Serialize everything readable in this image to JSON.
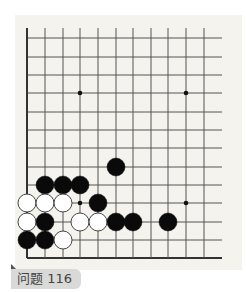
{
  "problem": {
    "label": "问题 116"
  },
  "board": {
    "col_x": [
      27,
      45,
      63,
      80,
      98,
      116,
      133,
      151,
      168,
      186,
      204
    ],
    "row_y": [
      38,
      57,
      75,
      93,
      112,
      130,
      148,
      167,
      185,
      203,
      222,
      240,
      258
    ],
    "line_right_x": 222,
    "line_top_y": 28,
    "star_points": [
      [
        3,
        3
      ],
      [
        9,
        3
      ],
      [
        3,
        9
      ],
      [
        9,
        9
      ]
    ],
    "stone_radius": 9,
    "colors": {
      "background": "#f4f3ee",
      "line": "#555555",
      "edge_line": "#333333",
      "black_stone": "#0a0a0a",
      "white_stone": "#ffffff",
      "white_stone_border": "#333333"
    },
    "stones": [
      {
        "color": "black",
        "col": 5,
        "row": 7
      },
      {
        "color": "black",
        "col": 1,
        "row": 8
      },
      {
        "color": "black",
        "col": 2,
        "row": 8
      },
      {
        "color": "black",
        "col": 3,
        "row": 8
      },
      {
        "color": "white",
        "col": 0,
        "row": 9
      },
      {
        "color": "white",
        "col": 1,
        "row": 9
      },
      {
        "color": "white",
        "col": 2,
        "row": 9
      },
      {
        "color": "black",
        "col": 4,
        "row": 9
      },
      {
        "color": "white",
        "col": 0,
        "row": 10
      },
      {
        "color": "black",
        "col": 1,
        "row": 10
      },
      {
        "color": "white",
        "col": 3,
        "row": 10
      },
      {
        "color": "white",
        "col": 4,
        "row": 10
      },
      {
        "color": "black",
        "col": 5,
        "row": 10
      },
      {
        "color": "black",
        "col": 6,
        "row": 10
      },
      {
        "color": "black",
        "col": 8,
        "row": 10
      },
      {
        "color": "black",
        "col": 0,
        "row": 11
      },
      {
        "color": "black",
        "col": 1,
        "row": 11
      },
      {
        "color": "white",
        "col": 2,
        "row": 11
      }
    ]
  }
}
